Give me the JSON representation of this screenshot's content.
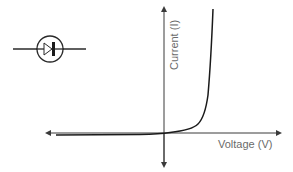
{
  "diagram": {
    "symbol": "diode-symbol",
    "axes": {
      "x_label": "Voltage (V)",
      "y_label": "Current (I)"
    },
    "colors": {
      "line": "#1a1a1a",
      "axis": "#3a3a3a",
      "text": "#6a6a6a"
    }
  }
}
